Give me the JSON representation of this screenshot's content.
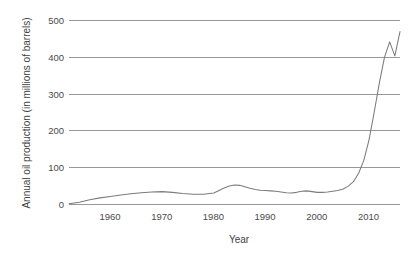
{
  "chart_data": {
    "type": "line",
    "title": "",
    "subtitle": "",
    "xlabel": "Year",
    "ylabel": "Annual oil production (in millions of barrels)",
    "xlim": [
      1952,
      2016
    ],
    "ylim": [
      0,
      500
    ],
    "xticks": [
      1960,
      1970,
      1980,
      1990,
      2000,
      2010
    ],
    "xtick_labels": [
      "1960",
      "1970",
      "1980",
      "1990",
      "2000",
      "2010"
    ],
    "yticks": [
      0,
      100,
      200,
      300,
      400,
      500
    ],
    "ytick_labels": [
      "0",
      "100",
      "200",
      "300",
      "400",
      "500"
    ],
    "grid": "horizontal",
    "legend": "none",
    "series": [
      {
        "name": "Annual oil production",
        "color": "#7b7b7b",
        "x": [
          1952,
          1954,
          1956,
          1958,
          1960,
          1962,
          1964,
          1966,
          1968,
          1970,
          1972,
          1974,
          1976,
          1978,
          1980,
          1981,
          1982,
          1983,
          1984,
          1985,
          1986,
          1987,
          1988,
          1989,
          1990,
          1991,
          1992,
          1993,
          1994,
          1995,
          1996,
          1997,
          1998,
          1999,
          2000,
          2001,
          2002,
          2003,
          2004,
          2005,
          2006,
          2007,
          2008,
          2009,
          2010,
          2011,
          2012,
          2013,
          2014,
          2015
        ],
        "values": [
          2,
          6,
          13,
          18,
          22,
          26,
          29,
          32,
          34,
          35,
          33,
          30,
          28,
          28,
          31,
          38,
          45,
          50,
          53,
          52,
          48,
          44,
          41,
          39,
          38,
          37,
          36,
          34,
          32,
          31,
          33,
          36,
          37,
          35,
          33,
          33,
          34,
          36,
          38,
          42,
          50,
          62,
          85,
          120,
          175,
          250,
          330,
          400,
          442,
          404
        ],
        "final_point": {
          "x": 2016,
          "value": 470
        }
      }
    ]
  }
}
